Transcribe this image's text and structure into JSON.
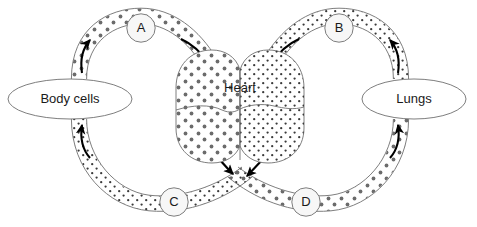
{
  "diagram": {
    "background_color": "#ffffff",
    "outline_color": "#5a5a5a",
    "text_color": "#1a1a1a",
    "arrow_color": "#000000",
    "dot_color_large": "#6b6b6b",
    "dot_color_small": "#3a3a3a",
    "node_fill": "#f7f7f7"
  },
  "organs": {
    "body_cells": {
      "label": "Body cells",
      "shape": "ellipse",
      "cx": 70,
      "cy": 99
    },
    "lungs": {
      "label": "Lungs",
      "shape": "ellipse",
      "cx": 414,
      "cy": 99
    },
    "heart": {
      "label": "Heart",
      "shape": "heart",
      "cx": 240,
      "cy": 110,
      "chambers": 4
    }
  },
  "vessels": [
    {
      "id": "A",
      "label": "A",
      "from": "Body cells",
      "to": "Heart",
      "position": "top-left",
      "flow_direction": "toward-heart",
      "dot_style": "large"
    },
    {
      "id": "B",
      "label": "B",
      "from": "Lungs",
      "to": "Heart",
      "position": "top-right",
      "flow_direction": "toward-heart",
      "dot_style": "small"
    },
    {
      "id": "C",
      "label": "C",
      "from": "Heart",
      "to": "Body cells",
      "position": "bottom-left",
      "flow_direction": "away-from-heart",
      "dot_style": "small"
    },
    {
      "id": "D",
      "label": "D",
      "from": "Heart",
      "to": "Lungs",
      "position": "bottom-right",
      "flow_direction": "away-from-heart",
      "dot_style": "large"
    }
  ],
  "arrows": {
    "count": 8,
    "descriptions": [
      "A outbound from body cells, pointing up-right",
      "A inbound to heart, pointing down-right",
      "B inbound to heart, pointing down-left",
      "B outbound from lungs, pointing up-left",
      "C outbound from heart, pointing down-right",
      "C inbound to body cells, pointing up-left",
      "D outbound from heart, pointing down-left",
      "D inbound to lungs, pointing up-right"
    ]
  }
}
